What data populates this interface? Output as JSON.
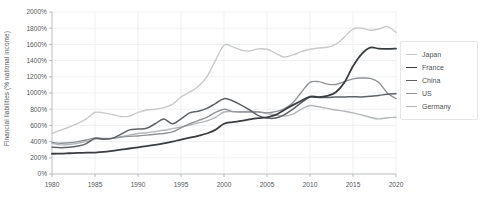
{
  "chart_data": {
    "type": "line",
    "title": "",
    "xlabel": "",
    "ylabel": "Financial liabilities (% national income)",
    "xlim": [
      1980,
      2020
    ],
    "ylim": [
      0,
      2000
    ],
    "grid": true,
    "legend_position": "right",
    "x_tick_labels": [
      "1980",
      "1985",
      "1990",
      "1995",
      "2000",
      "2005",
      "2010",
      "2015",
      "2020"
    ],
    "x_ticks": [
      1980,
      1985,
      1990,
      1995,
      2000,
      2005,
      2010,
      2015,
      2020
    ],
    "y_tick_labels": [
      "0%",
      "200%",
      "400%",
      "600%",
      "800%",
      "1000%",
      "1200%",
      "1400%",
      "1600%",
      "1800%",
      "2000%"
    ],
    "y_ticks": [
      0,
      200,
      400,
      600,
      800,
      1000,
      1200,
      1400,
      1600,
      1800,
      2000
    ],
    "x": [
      1980,
      1981,
      1982,
      1983,
      1984,
      1985,
      1986,
      1987,
      1988,
      1989,
      1990,
      1991,
      1992,
      1993,
      1994,
      1995,
      1996,
      1997,
      1998,
      1999,
      2000,
      2001,
      2002,
      2003,
      2004,
      2005,
      2006,
      2007,
      2008,
      2009,
      2010,
      2011,
      2012,
      2013,
      2014,
      2015,
      2016,
      2017,
      2018,
      2019,
      2020
    ],
    "series": [
      {
        "name": "Japan",
        "color": "#c7c9cb",
        "width": 1.4,
        "values": [
          500,
          540,
          580,
          625,
          680,
          760,
          755,
          735,
          710,
          715,
          760,
          790,
          800,
          820,
          860,
          950,
          1010,
          1080,
          1200,
          1400,
          1590,
          1570,
          1530,
          1520,
          1545,
          1540,
          1490,
          1445,
          1470,
          1510,
          1540,
          1555,
          1565,
          1600,
          1690,
          1790,
          1800,
          1775,
          1790,
          1820,
          1750
        ]
      },
      {
        "name": "France",
        "color": "#3a3d40",
        "width": 1.8,
        "values": [
          250,
          252,
          256,
          260,
          263,
          265,
          272,
          285,
          300,
          315,
          330,
          345,
          360,
          378,
          400,
          425,
          448,
          472,
          500,
          545,
          620,
          640,
          655,
          675,
          690,
          700,
          730,
          790,
          850,
          905,
          955,
          950,
          965,
          1010,
          1130,
          1330,
          1480,
          1560,
          1548,
          1545,
          1548
        ]
      },
      {
        "name": "China",
        "color": "#5e6266",
        "width": 1.5,
        "values": [
          330,
          325,
          330,
          345,
          375,
          440,
          430,
          440,
          490,
          545,
          555,
          565,
          620,
          680,
          620,
          680,
          755,
          775,
          810,
          870,
          930,
          905,
          850,
          790,
          720,
          690,
          690,
          730,
          800,
          880,
          950,
          945,
          945,
          950,
          950,
          955,
          950,
          960,
          970,
          985,
          990
        ]
      },
      {
        "name": "US",
        "color": "#909396",
        "width": 1.4,
        "values": [
          390,
          380,
          385,
          400,
          420,
          445,
          440,
          440,
          455,
          465,
          470,
          480,
          490,
          500,
          520,
          570,
          620,
          660,
          700,
          760,
          800,
          770,
          765,
          765,
          765,
          755,
          770,
          805,
          880,
          1010,
          1130,
          1140,
          1110,
          1105,
          1140,
          1175,
          1185,
          1180,
          1130,
          1000,
          930
        ]
      },
      {
        "name": "Germany",
        "color": "#b4b7b9",
        "width": 1.4,
        "values": [
          380,
          360,
          365,
          380,
          400,
          430,
          435,
          440,
          460,
          480,
          500,
          510,
          525,
          540,
          560,
          580,
          605,
          630,
          655,
          700,
          765,
          770,
          770,
          772,
          770,
          745,
          730,
          715,
          740,
          800,
          845,
          830,
          810,
          790,
          775,
          755,
          730,
          700,
          680,
          695,
          700
        ]
      }
    ]
  },
  "legend": {
    "items": [
      {
        "label": "Japan"
      },
      {
        "label": "France"
      },
      {
        "label": "China"
      },
      {
        "label": "US"
      },
      {
        "label": "Germany"
      }
    ]
  }
}
